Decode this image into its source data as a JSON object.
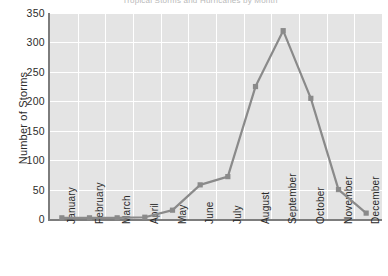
{
  "chart_data": {
    "type": "line",
    "title": "Tropical Storms and Hurricanes by Month",
    "xlabel": "",
    "ylabel": "Number of Storms",
    "categories": [
      "January",
      "February",
      "March",
      "April",
      "May",
      "June",
      "July",
      "August",
      "September",
      "October",
      "November",
      "December"
    ],
    "values": [
      2,
      2,
      2,
      3,
      15,
      58,
      72,
      225,
      320,
      205,
      50,
      10
    ],
    "series": [
      {
        "name": "Number of Storms",
        "values": [
          2,
          2,
          2,
          3,
          15,
          58,
          72,
          225,
          320,
          205,
          50,
          10
        ]
      }
    ],
    "ylim": [
      0,
      350
    ],
    "yticks": [
      0,
      50,
      100,
      150,
      200,
      250,
      300,
      350
    ],
    "ytick_labels": [
      "0",
      "50",
      "100",
      "150",
      "200",
      "250",
      "300",
      "350"
    ],
    "grid": true,
    "grid_color": "#ffffff",
    "plot_background": "#e4e4e4",
    "line_color": "#8a8a8a",
    "marker_color": "#8a8a8a",
    "marker_shape": "square",
    "legend": "none"
  }
}
